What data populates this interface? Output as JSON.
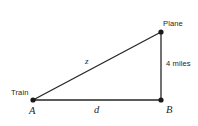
{
  "figure": {
    "type": "right-triangle-diagram",
    "background_color": "#ffffff",
    "stroke_color": "#262626",
    "vertices": [
      {
        "id": "A",
        "name": "Train",
        "label": "Train",
        "math_label": "A",
        "x": 33,
        "y": 100
      },
      {
        "id": "B",
        "name": "B",
        "label": "B",
        "math_label": "B",
        "x": 161,
        "y": 100
      },
      {
        "id": "C",
        "name": "Plane",
        "label": "Plane",
        "math_label": "",
        "x": 161,
        "y": 32
      }
    ],
    "edges": [
      {
        "id": "base",
        "from": "A",
        "to": "B",
        "label": "d",
        "label_style": "math"
      },
      {
        "id": "vertical",
        "from": "B",
        "to": "C",
        "label": "4 miles",
        "label_style": "plain"
      },
      {
        "id": "hypotenuse",
        "from": "A",
        "to": "C",
        "label": "z",
        "label_style": "math"
      }
    ],
    "labels": {
      "train": "Train",
      "plane": "Plane",
      "vertical_side": "4 miles",
      "vertex_a": "A",
      "vertex_b": "B",
      "base_side": "d",
      "hypotenuse_side": "z"
    }
  }
}
